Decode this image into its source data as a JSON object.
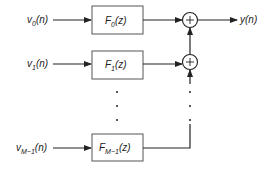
{
  "diagram": {
    "type": "synthesis filter bank",
    "inputs": [
      {
        "name": "v",
        "sub": "0",
        "arg": "(n)"
      },
      {
        "name": "v",
        "sub": "1",
        "arg": "(n)"
      },
      {
        "name": "v",
        "sub": "M−1",
        "arg": "(n)"
      }
    ],
    "filters": [
      {
        "name": "F",
        "sub": "0",
        "arg": "(z)"
      },
      {
        "name": "F",
        "sub": "1",
        "arg": "(z)"
      },
      {
        "name": "F",
        "sub": "M−1",
        "arg": "(z)"
      }
    ],
    "adders": [
      {
        "symbol": "+"
      },
      {
        "symbol": "+"
      }
    ],
    "output": {
      "name": "y",
      "arg": "(n)"
    },
    "ellipsis": "⋮",
    "colors": {
      "line": "#222222",
      "box": "#444444"
    }
  }
}
